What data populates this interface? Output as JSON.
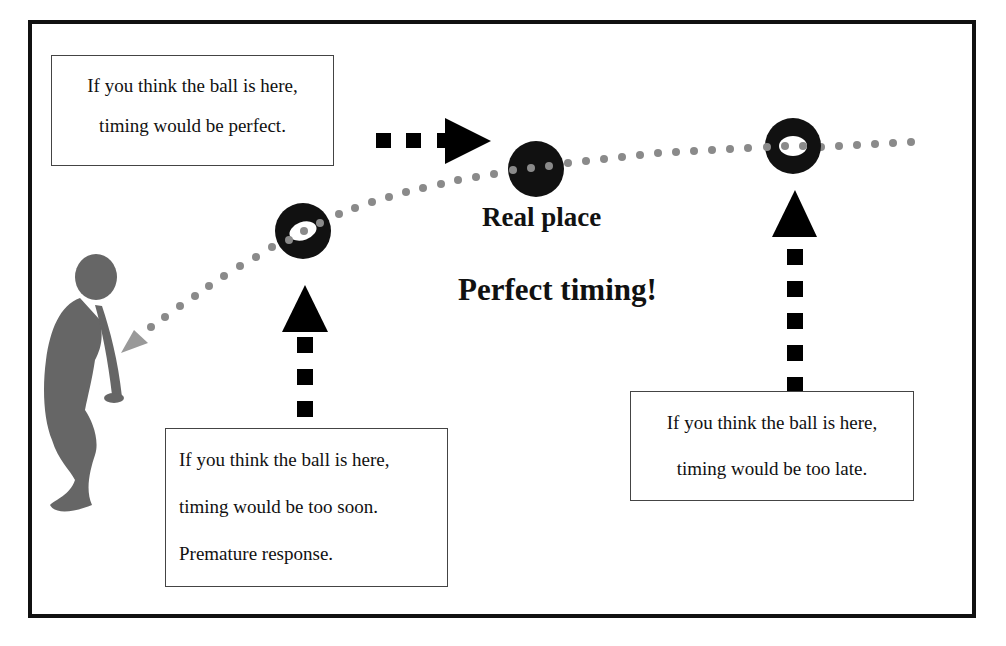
{
  "diagram": {
    "title": "Perfect timing!",
    "real_place_label": "Real place",
    "boxes": {
      "perfect": {
        "line1": "If you think the ball is here,",
        "line2": "timing would be perfect."
      },
      "too_soon": {
        "line1": "If you think the ball is here,",
        "line2": "timing would be too soon.",
        "line3": "Premature response."
      },
      "too_late": {
        "line1": "If you think the ball is here,",
        "line2": "timing would be too late."
      }
    },
    "colors": {
      "border": "#111111",
      "ball": "#111111",
      "trajectory_dots": "#8a8a8a",
      "figure": "#666666",
      "arrow": "#000000"
    }
  }
}
